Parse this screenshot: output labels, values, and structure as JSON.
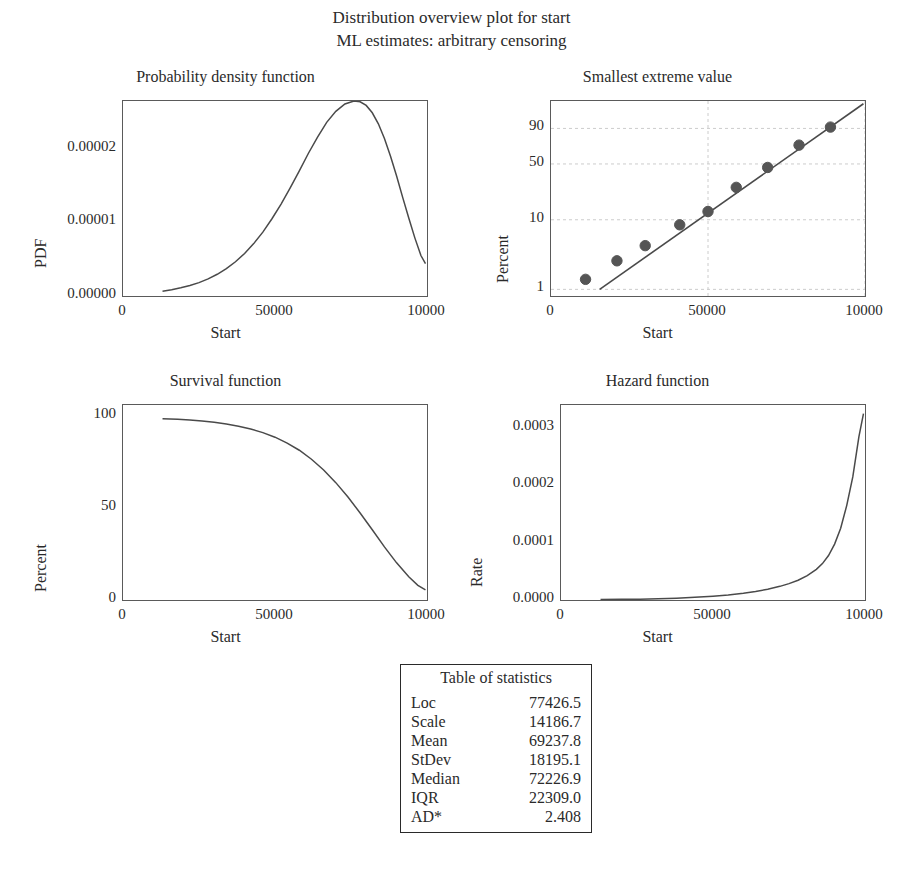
{
  "title": {
    "line1": "Distribution overview plot for start",
    "line2": "ML estimates: arbitrary censoring"
  },
  "variable": "Start",
  "colors": {
    "curve": "#4a4a4a",
    "frame": "#5a5a5a",
    "marker": "#555555",
    "grid": "#cccccc",
    "text": "#2a2a2a"
  },
  "chart_data": [
    {
      "type": "line",
      "title": "Probability density function",
      "xlabel": "Start",
      "ylabel": "PDF",
      "xlim": [
        0,
        100000
      ],
      "ylim": [
        0,
        2.65e-05
      ],
      "xticks": [
        0,
        50000,
        100000
      ],
      "xticklabels": [
        "0",
        "50000",
        "10000"
      ],
      "yticks": [
        0.0,
        1e-05,
        2e-05
      ],
      "yticklabels": [
        "0.00000",
        "0.00001",
        "0.00002"
      ],
      "grid": false,
      "x": [
        13000,
        16000,
        19000,
        22000,
        25000,
        28000,
        31000,
        34000,
        37000,
        40000,
        43000,
        46000,
        49000,
        52000,
        55000,
        58000,
        61000,
        64000,
        67000,
        70000,
        73000,
        76000,
        78000,
        80000,
        82000,
        84000,
        86000,
        88000,
        90000,
        92000,
        94000,
        96000,
        98000,
        99500
      ],
      "y": [
        6.5e-07,
        8.5e-07,
        1.12e-06,
        1.42e-06,
        1.82e-06,
        2.32e-06,
        2.95e-06,
        3.72e-06,
        4.65e-06,
        5.78e-06,
        7.12e-06,
        8.68e-06,
        1.05e-05,
        1.25e-05,
        1.47e-05,
        1.7e-05,
        1.94e-05,
        2.16e-05,
        2.36e-05,
        2.51e-05,
        2.61e-05,
        2.65e-05,
        2.64e-05,
        2.59e-05,
        2.49e-05,
        2.34e-05,
        2.14e-05,
        1.9e-05,
        1.63e-05,
        1.34e-05,
        1.06e-05,
        7.9e-06,
        5.5e-06,
        4.4e-06
      ]
    },
    {
      "type": "scatter",
      "title": "Smallest extreme value",
      "xlabel": "Start",
      "ylabel": "Percent",
      "xlim": [
        0,
        100000
      ],
      "xticks": [
        0,
        50000,
        100000
      ],
      "xticklabels": [
        "0",
        "50000",
        "10000"
      ],
      "yticklabels": [
        "90",
        "50",
        "10",
        "1"
      ],
      "yticks": [
        90,
        50,
        10,
        1
      ],
      "grid": true,
      "points": [
        {
          "x": 11000,
          "percent": 1.4
        },
        {
          "x": 21000,
          "percent": 2.6
        },
        {
          "x": 30000,
          "percent": 4.3
        },
        {
          "x": 41000,
          "percent": 8.5
        },
        {
          "x": 50000,
          "percent": 13.0
        },
        {
          "x": 59000,
          "percent": 27.0
        },
        {
          "x": 69000,
          "percent": 46.0
        },
        {
          "x": 79000,
          "percent": 73.0
        },
        {
          "x": 89000,
          "percent": 91.0
        }
      ],
      "fit_line": {
        "x0": 15500,
        "y0": 1.0,
        "x1": 99500,
        "y1": 99.5
      }
    },
    {
      "type": "line",
      "title": "Survival function",
      "xlabel": "Start",
      "ylabel": "Percent",
      "xlim": [
        0,
        100000
      ],
      "ylim": [
        0,
        106
      ],
      "xticks": [
        0,
        50000,
        100000
      ],
      "xticklabels": [
        "0",
        "50000",
        "10000"
      ],
      "yticks": [
        0,
        50,
        100
      ],
      "yticklabels": [
        "0",
        "50",
        "100"
      ],
      "grid": false,
      "x": [
        13000,
        18000,
        22000,
        26000,
        30000,
        34000,
        38000,
        42000,
        46000,
        50000,
        54000,
        58000,
        62000,
        66000,
        70000,
        74000,
        78000,
        82000,
        86000,
        90000,
        94000,
        97000,
        99500
      ],
      "y": [
        98.5,
        98.2,
        97.8,
        97.3,
        96.6,
        95.7,
        94.5,
        93.0,
        91.0,
        88.5,
        85.3,
        81.4,
        76.5,
        70.7,
        63.8,
        56.0,
        47.3,
        38.2,
        28.9,
        20.2,
        12.6,
        8.0,
        5.5
      ]
    },
    {
      "type": "line",
      "title": "Hazard function",
      "xlabel": "Start",
      "ylabel": "Rate",
      "xlim": [
        0,
        100000
      ],
      "ylim": [
        0,
        0.00034
      ],
      "xticks": [
        0,
        50000,
        100000
      ],
      "xticklabels": [
        "0",
        "50000",
        "10000"
      ],
      "yticks": [
        0.0,
        0.0001,
        0.0002,
        0.0003
      ],
      "yticklabels": [
        "0.0000",
        "0.0001",
        "0.0002",
        "0.0003"
      ],
      "grid": false,
      "x": [
        13000,
        20000,
        26000,
        32000,
        38000,
        44000,
        50000,
        55000,
        60000,
        64000,
        68000,
        72000,
        75000,
        78000,
        81000,
        84000,
        86000,
        88000,
        90000,
        92000,
        94000,
        96000,
        98000,
        99500
      ],
      "y": [
        8e-07,
        1.1e-06,
        1.5e-06,
        2.2e-06,
        3.2e-06,
        4.6e-06,
        6.6e-06,
        8.8e-06,
        1.18e-05,
        1.48e-05,
        1.88e-05,
        2.38e-05,
        2.85e-05,
        3.45e-05,
        4.25e-05,
        5.35e-05,
        6.35e-05,
        7.75e-05,
        9.75e-05,
        0.000125,
        0.000165,
        0.000215,
        0.000285,
        0.000325
      ]
    }
  ],
  "stats_table": {
    "header": "Table of statistics",
    "rows": [
      {
        "key": "Loc",
        "value": "77426.5"
      },
      {
        "key": "Scale",
        "value": "14186.7"
      },
      {
        "key": "Mean",
        "value": "69237.8"
      },
      {
        "key": "StDev",
        "value": "18195.1"
      },
      {
        "key": "Median",
        "value": "72226.9"
      },
      {
        "key": "IQR",
        "value": "22309.0"
      },
      {
        "key": "AD*",
        "value": "2.408"
      }
    ]
  }
}
